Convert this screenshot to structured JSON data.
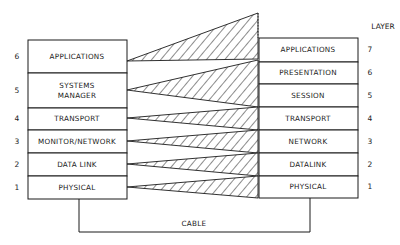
{
  "diagram": {
    "layer_header": "LAYER",
    "left_stack": {
      "layers": [
        {
          "number": "6",
          "label_lines": [
            "APPLICATIONS"
          ]
        },
        {
          "number": "5",
          "label_lines": [
            "SYSTEMS",
            "MANAGER"
          ]
        },
        {
          "number": "4",
          "label_lines": [
            "TRANSPORT"
          ]
        },
        {
          "number": "3",
          "label_lines": [
            "MONITOR/NETWORK"
          ]
        },
        {
          "number": "2",
          "label_lines": [
            "DATA LINK"
          ]
        },
        {
          "number": "1",
          "label_lines": [
            "PHYSICAL"
          ]
        }
      ]
    },
    "right_stack": {
      "layers": [
        {
          "number": "7",
          "label": "APPLICATIONS"
        },
        {
          "number": "6",
          "label": "PRESENTATION"
        },
        {
          "number": "5",
          "label": "SESSION"
        },
        {
          "number": "4",
          "label": "TRANSPORT"
        },
        {
          "number": "3",
          "label": "NETWORK"
        },
        {
          "number": "2",
          "label": "DATALINK"
        },
        {
          "number": "1",
          "label": "PHYSICAL"
        }
      ]
    },
    "mappings": [
      {
        "from": "APPLICATIONS",
        "to": [
          "APPLICATIONS",
          "PRESENTATION"
        ]
      },
      {
        "from": "SYSTEMS MANAGER",
        "to": [
          "SESSION"
        ]
      },
      {
        "from": "TRANSPORT",
        "to": [
          "TRANSPORT"
        ]
      },
      {
        "from": "MONITOR/NETWORK",
        "to": [
          "NETWORK"
        ]
      },
      {
        "from": "DATA LINK",
        "to": [
          "DATALINK"
        ]
      },
      {
        "from": "PHYSICAL",
        "to": [
          "PHYSICAL"
        ]
      }
    ],
    "cable_label": "CABLE"
  }
}
